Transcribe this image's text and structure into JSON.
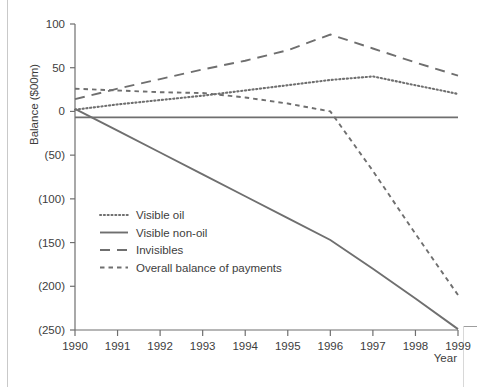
{
  "chart_data": {
    "type": "line",
    "title": "",
    "xlabel": "Year",
    "ylabel": "Balance ($00m)",
    "x": [
      1990,
      1991,
      1992,
      1993,
      1994,
      1995,
      1996,
      1997,
      1998,
      1999
    ],
    "xticklabels": [
      "1990",
      "1991",
      "1992",
      "1993",
      "1994",
      "1995",
      "1996",
      "1997",
      "1998",
      "1999"
    ],
    "yticks": [
      100,
      50,
      0,
      -50,
      -100,
      -150,
      -200,
      -250
    ],
    "yticklabels": [
      "100",
      "50",
      "0",
      "(50)",
      "(100)",
      "(150)",
      "(200)",
      "(250)"
    ],
    "ylim": [
      -250,
      100
    ],
    "xlim": [
      1990,
      1999
    ],
    "grid": false,
    "legend_position": "inside-lower-left",
    "series": [
      {
        "name": "Visible oil",
        "style": "dotted",
        "color": "#6f6f6f",
        "values": [
          2,
          8,
          13,
          18,
          24,
          30,
          36,
          40,
          30,
          20
        ]
      },
      {
        "name": "Visible non-oil",
        "style": "solid",
        "color": "#6f6f6f",
        "values": [
          3,
          -22,
          -47,
          -72,
          -97,
          -122,
          -147,
          -180,
          -214,
          -249
        ]
      },
      {
        "name": "Invisibles",
        "style": "long-dash",
        "color": "#6f6f6f",
        "values": [
          14,
          26,
          37,
          48,
          58,
          70,
          88,
          72,
          56,
          41
        ]
      },
      {
        "name": "Overall balance of payments",
        "style": "short-dash",
        "color": "#6f6f6f",
        "values": [
          26,
          24,
          22,
          21,
          16,
          9,
          0,
          -68,
          -140,
          -210
        ]
      }
    ]
  },
  "legend": {
    "items": [
      {
        "label": "Visible oil",
        "style": "dotted"
      },
      {
        "label": "Visible non-oil",
        "style": "solid"
      },
      {
        "label": "Invisibles",
        "style": "long-dash"
      },
      {
        "label": "Overall balance of payments",
        "style": "short-dash"
      }
    ]
  },
  "colors": {
    "ink": "#3d3d3d",
    "line": "#6f6f6f",
    "background": "#ffffff",
    "page_rule": "#c9c9c9"
  }
}
